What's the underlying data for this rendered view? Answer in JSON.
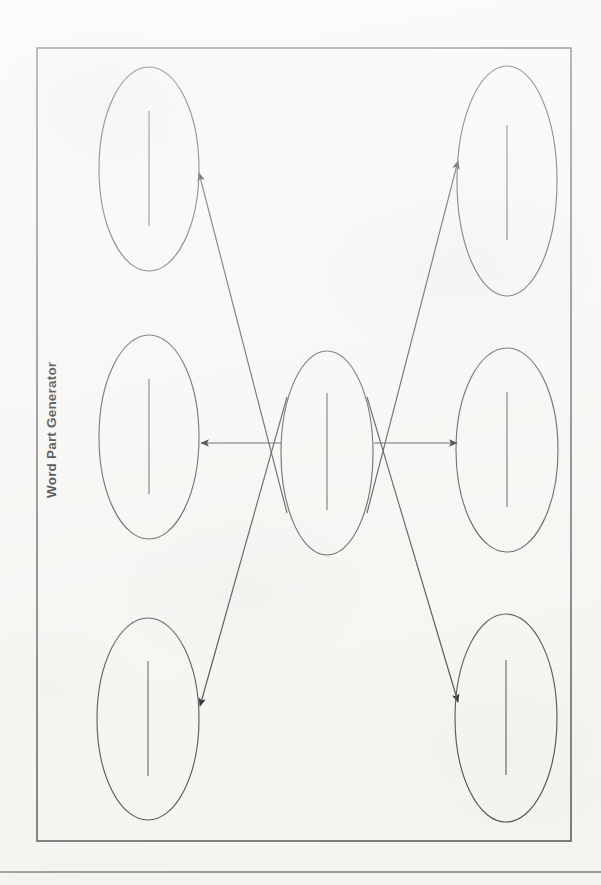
{
  "page": {
    "title": "Word Part Generator",
    "background_color": "#f7f6f3",
    "width": 601,
    "height": 885
  },
  "frame": {
    "name": "worksheet-border",
    "x": 37,
    "y": 48,
    "width": 534,
    "height": 793,
    "stroke_color": "#5a5a5a"
  },
  "footer_rule": {
    "y": 872,
    "stroke_color": "#7c7c7c"
  },
  "diagram": {
    "type": "word-web",
    "center_bubble": {
      "name": "center-bubble",
      "label": "",
      "cx": 327,
      "cy": 453,
      "rx": 46,
      "ry": 102,
      "writing_line": {
        "x": 327,
        "y1": 393,
        "y2": 510
      }
    },
    "outer_bubbles": [
      {
        "name": "bubble-top-left",
        "label": "",
        "cx": 149,
        "cy": 169,
        "rx": 50,
        "ry": 102,
        "writing_line": {
          "x": 149,
          "y1": 111,
          "y2": 226
        }
      },
      {
        "name": "bubble-middle-left",
        "label": "",
        "cx": 149,
        "cy": 437,
        "rx": 50,
        "ry": 102,
        "writing_line": {
          "x": 149,
          "y1": 379,
          "y2": 494
        }
      },
      {
        "name": "bubble-bottom-left",
        "label": "",
        "cx": 148,
        "cy": 719,
        "rx": 51,
        "ry": 101,
        "writing_line": {
          "x": 148,
          "y1": 661,
          "y2": 776
        }
      },
      {
        "name": "bubble-top-right",
        "label": "",
        "cx": 507,
        "cy": 181,
        "rx": 50,
        "ry": 115,
        "writing_line": {
          "x": 507,
          "y1": 125,
          "y2": 240
        }
      },
      {
        "name": "bubble-middle-right",
        "label": "",
        "cx": 507,
        "cy": 450,
        "rx": 51,
        "ry": 102,
        "writing_line": {
          "x": 507,
          "y1": 392,
          "y2": 507
        }
      },
      {
        "name": "bubble-bottom-right",
        "label": "",
        "cx": 506,
        "cy": 718,
        "rx": 51,
        "ry": 104,
        "writing_line": {
          "x": 506,
          "y1": 660,
          "y2": 775
        }
      }
    ],
    "connectors": [
      {
        "name": "arrow-center-to-top-left",
        "x1": 287,
        "y1": 513,
        "x2": 199,
        "y2": 173
      },
      {
        "name": "arrow-center-to-middle-left",
        "x1": 281,
        "y1": 443,
        "x2": 201,
        "y2": 443
      },
      {
        "name": "arrow-center-to-bottom-left",
        "x1": 287,
        "y1": 397,
        "x2": 200,
        "y2": 706
      },
      {
        "name": "arrow-center-to-top-right",
        "x1": 367,
        "y1": 513,
        "x2": 458,
        "y2": 161
      },
      {
        "name": "arrow-center-to-middle-right",
        "x1": 374,
        "y1": 443,
        "x2": 457,
        "y2": 443
      },
      {
        "name": "arrow-center-to-bottom-right",
        "x1": 367,
        "y1": 397,
        "x2": 458,
        "y2": 702
      }
    ],
    "arrow_color": "#1d1d1d",
    "bubble_stroke_color": "#4a4a4a"
  }
}
